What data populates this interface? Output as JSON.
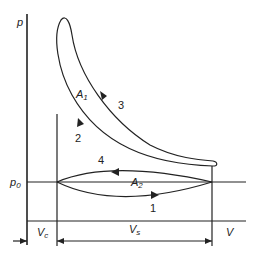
{
  "diagram": {
    "type": "p-V indicator diagram (pumping loop)",
    "axes": {
      "y_label": "p",
      "x_label": "V"
    },
    "reference_line": {
      "label_main": "p",
      "label_sub": "0"
    },
    "areas": [
      {
        "id": "A1",
        "label_main": "A",
        "label_sub": "1"
      },
      {
        "id": "A2",
        "label_main": "A",
        "label_sub": "2"
      }
    ],
    "process_labels": [
      "1",
      "2",
      "3",
      "4"
    ],
    "volumes": {
      "clearance": {
        "label_main": "V",
        "label_sub": "c"
      },
      "swept": {
        "label_main": "V",
        "label_sub": "s"
      }
    },
    "line_color": "#222222",
    "background": "#ffffff"
  }
}
